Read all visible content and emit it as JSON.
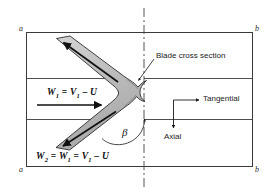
{
  "figure": {
    "type": "blade-cascade-velocity-diagram",
    "frame": {
      "corner_top_left": "a",
      "corner_top_right": "b",
      "corner_bottom_left": "a",
      "corner_bottom_right": "b"
    },
    "annotations": {
      "blade_cross_section": "Blade cross section",
      "tangential": "Tangential",
      "axial": "Axial",
      "beta_angle": "β"
    },
    "equations": {
      "inlet_relative_velocity": {
        "w": "W",
        "w_sub": "1",
        "eq": "=",
        "v": "V",
        "v_sub": "1",
        "minus": "–",
        "u": "U"
      },
      "outlet_relative_velocity": {
        "w2": "W",
        "w2_sub": "2",
        "eq1": "=",
        "w1": "W",
        "w1_sub": "1",
        "eq2": "=",
        "v": "V",
        "v_sub": "1",
        "minus": "–",
        "u": "U"
      }
    },
    "colors": {
      "blade_fill": "#b9b9b9",
      "blade_stroke": "#2c2c2c",
      "frame_stroke": "#3a3a3a",
      "centerline": "#555555",
      "arrow": "#111111",
      "text": "#1a1a1a"
    }
  }
}
